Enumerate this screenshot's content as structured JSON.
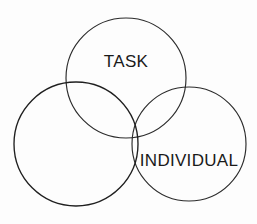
{
  "diagram": {
    "type": "venn",
    "background_color": "#fdfdfd",
    "stroke_color": "#2b2b2b",
    "hatch_color": "#6e6e6e",
    "label_color": "#1a1a1a",
    "circles": [
      {
        "id": "task",
        "label": "TASK",
        "cx": 126,
        "cy": 78,
        "r": 60,
        "fill": "none",
        "label_x": 126,
        "label_y": 67
      },
      {
        "id": "individual",
        "label": "INDIVIDUAL",
        "cx": 189,
        "cy": 144,
        "r": 57,
        "fill": "none",
        "label_x": 189,
        "label_y": 166
      },
      {
        "id": "shaded",
        "label": "",
        "cx": 76,
        "cy": 144,
        "r": 62,
        "fill": "hatch-diagonal",
        "label_x": 0,
        "label_y": 0
      }
    ],
    "hatch": {
      "direction": "forward-slash",
      "angle_degrees": 45,
      "spacing_px": 3,
      "line_width": 0.75
    }
  }
}
